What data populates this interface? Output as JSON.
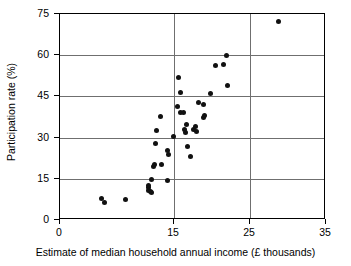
{
  "chart_data": {
    "type": "scatter",
    "title": "",
    "xlabel": "Estimate of median household annual income (£ thousands)",
    "ylabel": "Participation rate (%)",
    "xlim": [
      0,
      35
    ],
    "ylim": [
      0,
      75
    ],
    "xticks": [
      0,
      15,
      25,
      35
    ],
    "yticks": [
      0,
      15,
      30,
      45,
      60,
      75
    ],
    "xtick_labels": [
      "0",
      "15",
      "25",
      "35"
    ],
    "ytick_labels": [
      "0",
      "15",
      "30",
      "45",
      "60",
      "75"
    ],
    "grid": "horizontal gridlines at every y tick; vertical gridlines at 15 and 25",
    "legend": "none",
    "marker": "filled black circle",
    "points": [
      {
        "x": 5.4,
        "y": 8.0
      },
      {
        "x": 5.9,
        "y": 6.2
      },
      {
        "x": 8.6,
        "y": 7.6
      },
      {
        "x": 11.6,
        "y": 11.8
      },
      {
        "x": 11.7,
        "y": 10.8
      },
      {
        "x": 11.7,
        "y": 12.6
      },
      {
        "x": 11.9,
        "y": 10.4
      },
      {
        "x": 12.0,
        "y": 14.6
      },
      {
        "x": 12.1,
        "y": 9.9
      },
      {
        "x": 12.3,
        "y": 19.6
      },
      {
        "x": 12.4,
        "y": 20.3
      },
      {
        "x": 12.5,
        "y": 27.9
      },
      {
        "x": 12.7,
        "y": 32.6
      },
      {
        "x": 13.2,
        "y": 37.8
      },
      {
        "x": 13.4,
        "y": 20.2
      },
      {
        "x": 14.1,
        "y": 14.2
      },
      {
        "x": 14.2,
        "y": 25.3
      },
      {
        "x": 14.3,
        "y": 23.9
      },
      {
        "x": 14.9,
        "y": 30.4
      },
      {
        "x": 15.5,
        "y": 41.4
      },
      {
        "x": 15.6,
        "y": 51.9
      },
      {
        "x": 15.9,
        "y": 46.5
      },
      {
        "x": 15.9,
        "y": 39.2
      },
      {
        "x": 16.2,
        "y": 39.0
      },
      {
        "x": 16.4,
        "y": 32.8
      },
      {
        "x": 16.5,
        "y": 31.9
      },
      {
        "x": 16.6,
        "y": 34.9
      },
      {
        "x": 16.8,
        "y": 26.6
      },
      {
        "x": 17.2,
        "y": 23.0
      },
      {
        "x": 17.6,
        "y": 32.8
      },
      {
        "x": 17.8,
        "y": 33.9
      },
      {
        "x": 17.9,
        "y": 32.3
      },
      {
        "x": 18.2,
        "y": 42.6
      },
      {
        "x": 18.9,
        "y": 37.5
      },
      {
        "x": 18.9,
        "y": 42.0
      },
      {
        "x": 19.0,
        "y": 38.0
      },
      {
        "x": 19.8,
        "y": 46.2
      },
      {
        "x": 20.5,
        "y": 56.4
      },
      {
        "x": 21.5,
        "y": 56.6
      },
      {
        "x": 21.9,
        "y": 60.0
      },
      {
        "x": 22.0,
        "y": 48.9
      },
      {
        "x": 28.8,
        "y": 72.4
      }
    ]
  },
  "colors": {
    "marker": "#111111",
    "gridline": "#6f6f6f",
    "axis": "#000000",
    "background": "#ffffff"
  }
}
